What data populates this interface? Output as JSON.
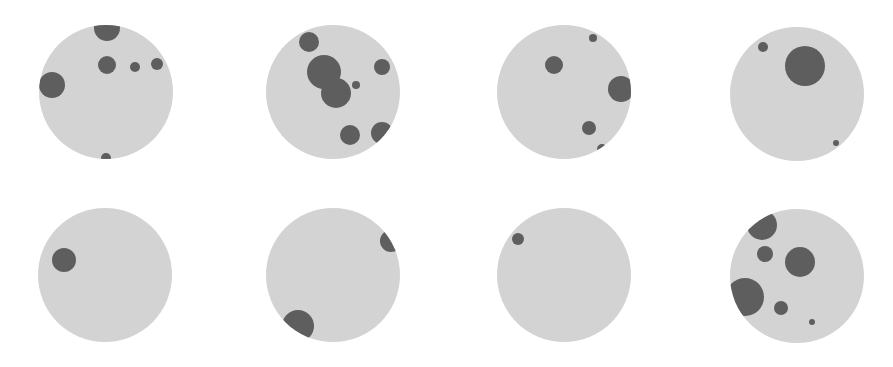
{
  "figure": {
    "width": 893,
    "height": 367,
    "background": "#ffffff",
    "disk_color": "#d3d3d3",
    "blob_color": "#5e5e5e",
    "panels": [
      {
        "id": "panel-1",
        "cx": 106,
        "cy": 92,
        "r": 67,
        "blobs": [
          {
            "x": 107,
            "y": 28,
            "r": 13
          },
          {
            "x": 107,
            "y": 65,
            "r": 9
          },
          {
            "x": 135,
            "y": 67,
            "r": 5
          },
          {
            "x": 157,
            "y": 64,
            "r": 6
          },
          {
            "x": 52,
            "y": 85,
            "r": 13
          },
          {
            "x": 106,
            "y": 158,
            "r": 5
          }
        ]
      },
      {
        "id": "panel-2",
        "cx": 333,
        "cy": 92,
        "r": 67,
        "blobs": [
          {
            "x": 309,
            "y": 42,
            "r": 10
          },
          {
            "x": 324,
            "y": 72,
            "r": 17
          },
          {
            "x": 336,
            "y": 93,
            "r": 15
          },
          {
            "x": 356,
            "y": 85,
            "r": 4
          },
          {
            "x": 382,
            "y": 67,
            "r": 8
          },
          {
            "x": 350,
            "y": 135,
            "r": 10
          },
          {
            "x": 382,
            "y": 133,
            "r": 11
          }
        ]
      },
      {
        "id": "panel-3",
        "cx": 564,
        "cy": 92,
        "r": 67,
        "blobs": [
          {
            "x": 593,
            "y": 38,
            "r": 4
          },
          {
            "x": 554,
            "y": 65,
            "r": 9
          },
          {
            "x": 621,
            "y": 89,
            "r": 13
          },
          {
            "x": 589,
            "y": 128,
            "r": 7
          },
          {
            "x": 602,
            "y": 149,
            "r": 5
          }
        ]
      },
      {
        "id": "panel-4",
        "cx": 797,
        "cy": 94,
        "r": 67,
        "blobs": [
          {
            "x": 763,
            "y": 47,
            "r": 5
          },
          {
            "x": 805,
            "y": 66,
            "r": 20
          },
          {
            "x": 836,
            "y": 143,
            "r": 3
          }
        ]
      },
      {
        "id": "panel-5",
        "cx": 105,
        "cy": 275,
        "r": 67,
        "blobs": [
          {
            "x": 64,
            "y": 260,
            "r": 12
          }
        ]
      },
      {
        "id": "panel-6",
        "cx": 333,
        "cy": 275,
        "r": 67,
        "blobs": [
          {
            "x": 391,
            "y": 241,
            "r": 11
          },
          {
            "x": 298,
            "y": 326,
            "r": 16
          }
        ]
      },
      {
        "id": "panel-7",
        "cx": 564,
        "cy": 275,
        "r": 67,
        "blobs": [
          {
            "x": 518,
            "y": 239,
            "r": 6
          }
        ]
      },
      {
        "id": "panel-8",
        "cx": 797,
        "cy": 276,
        "r": 67,
        "blobs": [
          {
            "x": 762,
            "y": 225,
            "r": 15
          },
          {
            "x": 765,
            "y": 254,
            "r": 8
          },
          {
            "x": 800,
            "y": 262,
            "r": 15
          },
          {
            "x": 745,
            "y": 297,
            "r": 19
          },
          {
            "x": 781,
            "y": 308,
            "r": 7
          },
          {
            "x": 812,
            "y": 322,
            "r": 3
          }
        ]
      }
    ]
  }
}
